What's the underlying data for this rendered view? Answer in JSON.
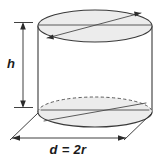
{
  "figure": {
    "title": "Cylinder with height and diameter dimensions",
    "shape": "cylinder",
    "background_color": "#ffffff",
    "stroke_color": "#3a3a3a",
    "fill_color": "#ececec",
    "text_color": "#1a1a1a"
  },
  "labels": {
    "height": "h",
    "diameter": "d = 2r"
  },
  "annotations": {
    "height_dimension_name": "height-dimension",
    "diameter_dimension_name": "diameter-dimension",
    "top_face_name": "top-ellipse-face",
    "bottom_face_name": "bottom-ellipse-face"
  },
  "geometry": {
    "top_ellipse": {
      "cx": 95,
      "cy": 26,
      "rx": 57,
      "ry": 16
    },
    "bottom_ellipse": {
      "cx": 95,
      "cy": 112,
      "rx": 57,
      "ry": 15
    },
    "left_edge_x": 38,
    "right_edge_x": 152,
    "height_px": 86
  }
}
